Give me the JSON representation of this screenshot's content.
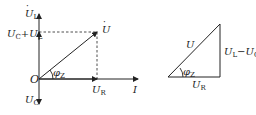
{
  "phasor_diagram": {
    "origin_label": "O",
    "axis_up_label": "U",
    "axis_up_sub": "L",
    "sum_label_a": "U",
    "sum_label_a_sub": "C",
    "sum_label_plus": "+",
    "sum_label_b": "U",
    "sum_label_b_sub": "L",
    "axis_down_label": "U",
    "axis_down_sub": "C",
    "resultant_label": "U",
    "resistive_label": "U",
    "resistive_sub": "R",
    "current_label": "I",
    "angle_label": "φ",
    "angle_sub": "Z",
    "dot": "·"
  },
  "voltage_triangle": {
    "hypotenuse_label": "U",
    "base_label": "U",
    "base_sub": "R",
    "side_label_a": "U",
    "side_label_a_sub": "L",
    "side_label_minus": "−",
    "side_label_b": "U",
    "side_label_b_sub": "C",
    "angle_label": "φ",
    "angle_sub": "Z"
  },
  "colors": {
    "line": "#222222",
    "background": "#ffffff"
  }
}
